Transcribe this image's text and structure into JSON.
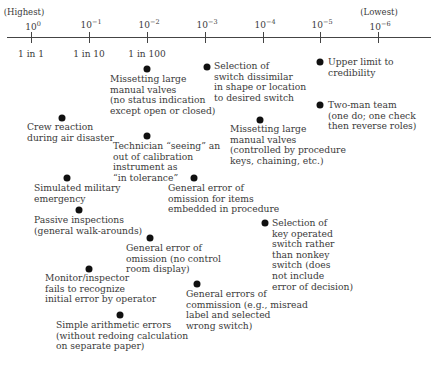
{
  "axis": {
    "highest_label": "(Highest)",
    "lowest_label": "(Lowest)",
    "ticks": [
      {
        "base": "10",
        "exp": "0",
        "ratio": "1 in 1",
        "x": 31
      },
      {
        "base": "10",
        "exp": "−1",
        "ratio": "1 in 10",
        "x": 89
      },
      {
        "base": "10",
        "exp": "−2",
        "ratio": "1 in 100",
        "x": 147
      },
      {
        "base": "10",
        "exp": "−3",
        "ratio": "",
        "x": 205
      },
      {
        "base": "10",
        "exp": "−4",
        "ratio": "",
        "x": 263
      },
      {
        "base": "10",
        "exp": "−5",
        "ratio": "",
        "x": 320
      },
      {
        "base": "10",
        "exp": "−6",
        "ratio": "",
        "x": 378
      }
    ]
  },
  "items": [
    {
      "text": "Missetting large\nmanual valves\n(no status indication\nexcept open or closed)",
      "dot_x": 147,
      "dot_y": 69,
      "lx": 110,
      "ly": 74
    },
    {
      "text": "Selection of\nswitch dissimilar\nin shape or location\nto desired switch",
      "dot_x": 207,
      "dot_y": 67,
      "lx": 214,
      "ly": 61
    },
    {
      "text": "Upper limit to\ncredibility",
      "dot_x": 320,
      "dot_y": 62,
      "lx": 328,
      "ly": 57
    },
    {
      "text": "Two-man team\n(one do; one check\nthen reverse roles)",
      "dot_x": 320,
      "dot_y": 105,
      "lx": 328,
      "ly": 100
    },
    {
      "text": "Crew reaction\nduring air disaster",
      "dot_x": 62,
      "dot_y": 118,
      "lx": 27,
      "ly": 122
    },
    {
      "text": "Missetting large\nmanual valves\n(controlled by procedure\nkeys, chaining, etc.)",
      "dot_x": 260,
      "dot_y": 120,
      "lx": 230,
      "ly": 124
    },
    {
      "text": "Technician “seeing” an\nout of calibration\ninstrument as\n“in tolerance”",
      "dot_x": 147,
      "dot_y": 136,
      "lx": 113,
      "ly": 141
    },
    {
      "text": "Simulated military\nemergency",
      "dot_x": 67,
      "dot_y": 178,
      "lx": 34,
      "ly": 183
    },
    {
      "text": "General error of\nomission for items\nembedded in procedure",
      "dot_x": 194,
      "dot_y": 178,
      "lx": 168,
      "ly": 183
    },
    {
      "text": "Passive inspections\n(general walk-arounds)",
      "dot_x": 79,
      "dot_y": 210,
      "lx": 34,
      "ly": 215
    },
    {
      "text": "Selection of\nkey operated\nswitch rather\nthan nonkey\nswitch (does\nnot include\nerror of decision)",
      "dot_x": 265,
      "dot_y": 223,
      "lx": 272,
      "ly": 218
    },
    {
      "text": "General error of\nomission (no control\nroom display)",
      "dot_x": 150,
      "dot_y": 238,
      "lx": 126,
      "ly": 243
    },
    {
      "text": "Monitor/inspector\nfails to recognize\ninitial error by operator",
      "dot_x": 89,
      "dot_y": 269,
      "lx": 45,
      "ly": 273
    },
    {
      "text": "General errors of\ncommission (e.g., misread\nlabel and selected\nwrong switch)",
      "dot_x": 197,
      "dot_y": 284,
      "lx": 186,
      "ly": 289
    },
    {
      "text": "Simple arithmetic errors\n(without redoing calculation\non separate paper)",
      "dot_x": 120,
      "dot_y": 315,
      "lx": 56,
      "ly": 320
    }
  ]
}
